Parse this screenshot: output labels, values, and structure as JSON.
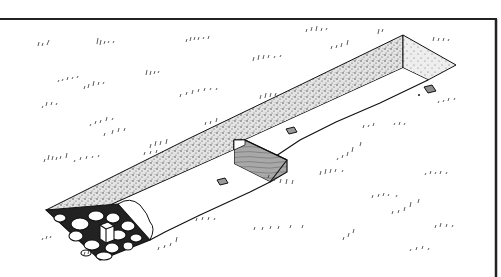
{
  "illustration": {
    "subject": "excavated trench in grassy field",
    "style": "black ink line drawing with stippling",
    "colors": {
      "background": "#ffffff",
      "ink": "#1a1a1a",
      "stipple_fill": "#d9d9d9",
      "wall_section_fill": "#9a9a9a",
      "marker_fill": "#8c8c8c"
    },
    "elements": {
      "frame_border": "top and right border lines",
      "trench_side_wall": "stippled sloped earth wall along far side",
      "trench_end_wall": "stippled wall at far right end",
      "trench_floor": "flat white floor",
      "section_step": "hatched vertical section face in middle",
      "square_markers": 3,
      "stone_fill": "cobblestones at near-left end",
      "grass_tufts": "scattered short strokes"
    }
  }
}
